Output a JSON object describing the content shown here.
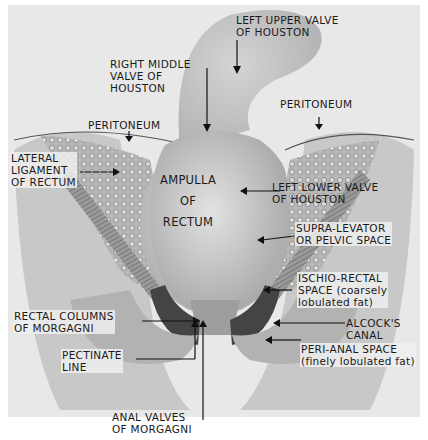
{
  "figure": {
    "labels": {
      "left_upper_valve": [
        "LEFT UPPER VALVE",
        "OF HOUSTON"
      ],
      "right_middle_valve": [
        "RIGHT MIDDLE",
        "VALVE OF",
        "HOUSTON"
      ],
      "peritoneum_left": "PERITONEUM",
      "peritoneum_right": "PERITONEUM",
      "lateral_ligament": [
        "LATERAL",
        "LIGAMENT",
        "OF RECTUM"
      ],
      "ampulla": [
        "AMPULLA",
        "OF",
        "RECTUM"
      ],
      "left_lower_valve": [
        "LEFT LOWER VALVE",
        "OF HOUSTON"
      ],
      "supra_levator": [
        "SUPRA-LEVATOR",
        "OR PELVIC SPACE"
      ],
      "ischio_rectal": [
        "ISCHIO-RECTAL",
        "SPACE (coarsely",
        "lobulated fat)"
      ],
      "alcocks_canal": [
        "ALCOCK'S",
        "CANAL"
      ],
      "peri_anal": [
        "PERI-ANAL SPACE",
        "(finely lobulated fat)"
      ],
      "rectal_columns": [
        "RECTAL COLUMNS",
        "OF MORGAGNI"
      ],
      "pectinate_line": [
        "PECTINATE",
        "LINE"
      ],
      "anal_valves": [
        "ANAL VALVES",
        "OF MORGAGNI"
      ]
    },
    "colors": {
      "background": "#e6e6e6",
      "rectum": "#c2c2c2",
      "tissue": "#8a8a8a",
      "ink": "#1a1a1a"
    }
  }
}
